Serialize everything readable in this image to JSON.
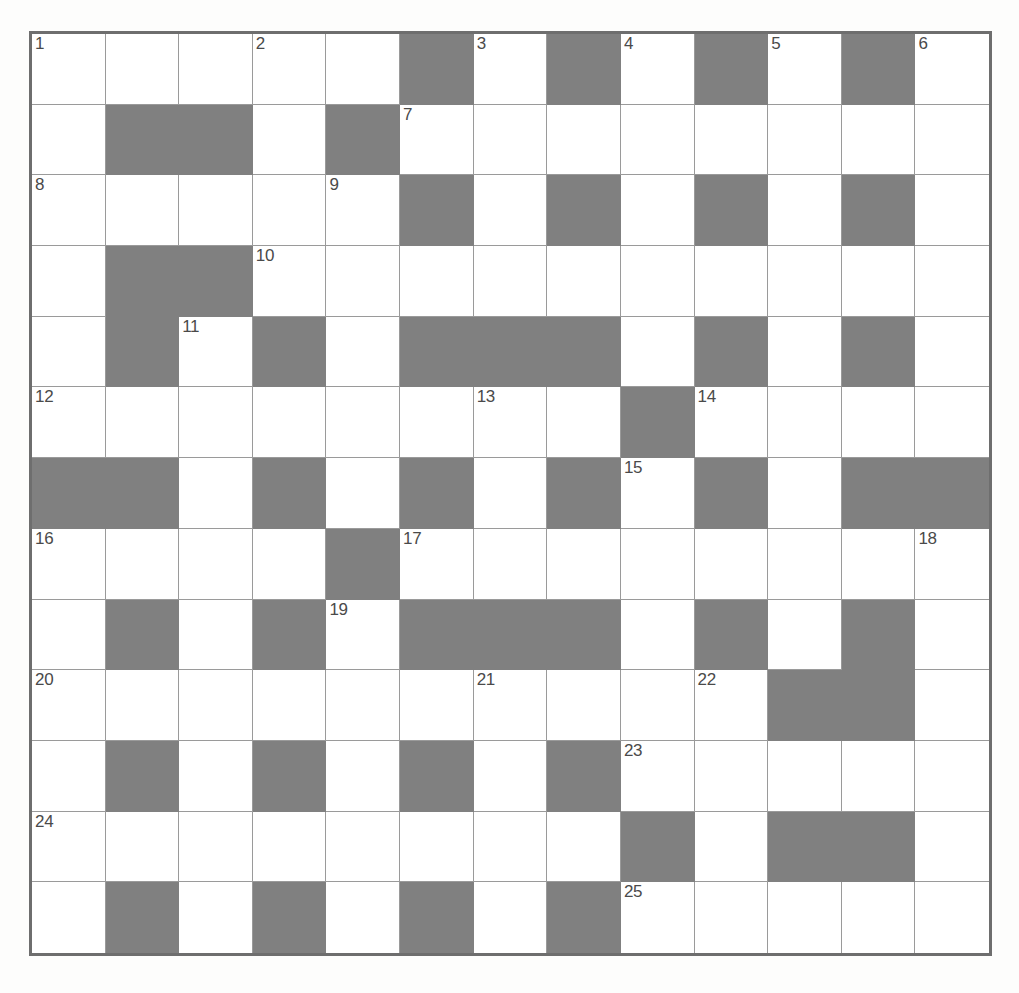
{
  "puzzle": {
    "type": "crossword-grid",
    "rows": 13,
    "columns": 13,
    "colors": {
      "page_background": "#fdfdfc",
      "cell_background": "#ffffff",
      "block_background": "#808080",
      "grid_line": "#9a9a9a",
      "grid_border": "#6e6e6e",
      "number_color": "#4a4a4a"
    },
    "max_clue_number": 25,
    "legend": {
      "open": "white cell",
      "block": "shaded cell"
    },
    "grid": [
      [
        "open",
        "open",
        "open",
        "open",
        "open",
        "block",
        "open",
        "block",
        "open",
        "block",
        "open",
        "block",
        "open"
      ],
      [
        "open",
        "block",
        "block",
        "open",
        "block",
        "open",
        "open",
        "open",
        "open",
        "open",
        "open",
        "open",
        "open"
      ],
      [
        "open",
        "open",
        "open",
        "open",
        "open",
        "block",
        "open",
        "block",
        "open",
        "block",
        "open",
        "block",
        "open"
      ],
      [
        "open",
        "block",
        "block",
        "open",
        "open",
        "open",
        "open",
        "open",
        "open",
        "open",
        "open",
        "open",
        "open"
      ],
      [
        "open",
        "block",
        "open",
        "block",
        "open",
        "block",
        "block",
        "block",
        "open",
        "block",
        "open",
        "block",
        "open"
      ],
      [
        "open",
        "open",
        "open",
        "open",
        "open",
        "open",
        "open",
        "open",
        "block",
        "open",
        "open",
        "open",
        "open"
      ],
      [
        "block",
        "block",
        "open",
        "block",
        "open",
        "block",
        "open",
        "block",
        "open",
        "block",
        "open",
        "block",
        "block"
      ],
      [
        "open",
        "open",
        "open",
        "open",
        "block",
        "open",
        "open",
        "open",
        "open",
        "open",
        "open",
        "open",
        "open"
      ],
      [
        "open",
        "block",
        "open",
        "block",
        "open",
        "block",
        "block",
        "block",
        "open",
        "block",
        "open",
        "block",
        "open"
      ],
      [
        "open",
        "open",
        "open",
        "open",
        "open",
        "open",
        "open",
        "open",
        "open",
        "open",
        "block",
        "block",
        "open"
      ],
      [
        "open",
        "block",
        "open",
        "block",
        "open",
        "block",
        "open",
        "block",
        "open",
        "open",
        "open",
        "open",
        "open"
      ],
      [
        "open",
        "open",
        "open",
        "open",
        "open",
        "open",
        "open",
        "open",
        "block",
        "open",
        "block",
        "block",
        "open"
      ],
      [
        "open",
        "block",
        "open",
        "block",
        "open",
        "block",
        "open",
        "block",
        "open",
        "open",
        "open",
        "open",
        "open"
      ]
    ],
    "numbers": [
      {
        "row": 1,
        "col": 1,
        "label": "1"
      },
      {
        "row": 1,
        "col": 4,
        "label": "2"
      },
      {
        "row": 1,
        "col": 7,
        "label": "3"
      },
      {
        "row": 1,
        "col": 9,
        "label": "4"
      },
      {
        "row": 1,
        "col": 11,
        "label": "5"
      },
      {
        "row": 1,
        "col": 13,
        "label": "6"
      },
      {
        "row": 2,
        "col": 6,
        "label": "7"
      },
      {
        "row": 3,
        "col": 1,
        "label": "8"
      },
      {
        "row": 3,
        "col": 5,
        "label": "9"
      },
      {
        "row": 4,
        "col": 4,
        "label": "10"
      },
      {
        "row": 5,
        "col": 3,
        "label": "11"
      },
      {
        "row": 6,
        "col": 1,
        "label": "12"
      },
      {
        "row": 6,
        "col": 7,
        "label": "13"
      },
      {
        "row": 6,
        "col": 10,
        "label": "14"
      },
      {
        "row": 7,
        "col": 9,
        "label": "15"
      },
      {
        "row": 8,
        "col": 1,
        "label": "16"
      },
      {
        "row": 8,
        "col": 6,
        "label": "17"
      },
      {
        "row": 8,
        "col": 13,
        "label": "18"
      },
      {
        "row": 9,
        "col": 5,
        "label": "19"
      },
      {
        "row": 10,
        "col": 1,
        "label": "20"
      },
      {
        "row": 10,
        "col": 7,
        "label": "21"
      },
      {
        "row": 10,
        "col": 10,
        "label": "22"
      },
      {
        "row": 11,
        "col": 9,
        "label": "23"
      },
      {
        "row": 12,
        "col": 1,
        "label": "24"
      },
      {
        "row": 13,
        "col": 9,
        "label": "25"
      }
    ],
    "letters": []
  }
}
